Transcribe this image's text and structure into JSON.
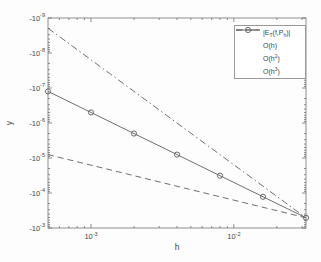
{
  "figure": {
    "title": ""
  },
  "colors": {
    "background": "#fdfdfd",
    "axis": "#8f8f8f",
    "tick": "#6f6f6f",
    "text": "#464646",
    "line": "#6f6f6f",
    "marker": "#5c5c5c"
  },
  "chart_data": {
    "type": "line",
    "title": "",
    "xlabel": "h",
    "ylabel": "y",
    "x_scale": "log",
    "y_scale": "negative-log",
    "grid": false,
    "legend_position": "top-right-inside",
    "xlim": [
      0.0005,
      0.032
    ],
    "ylim_exponents": [
      -9,
      -3
    ],
    "x_tick_base": "10",
    "x_tick_exponents": [
      -3,
      -2
    ],
    "y_tick_base": "-10",
    "y_tick_exponents": [
      -9,
      -8,
      -7,
      -6,
      -5,
      -4,
      -3
    ],
    "minor_x_decades": [
      -4,
      -3,
      -2
    ],
    "minor_y_decades": [
      -9,
      -8,
      -7,
      -6,
      -5,
      -4
    ],
    "data_series": {
      "name": "quadrature-error",
      "marker": "circle",
      "h_values": [
        0.0005,
        0.001,
        0.002,
        0.004,
        0.008,
        0.016,
        0.032
      ],
      "error_values": [
        -1.25e-07,
        -5e-07,
        -2e-06,
        -8e-06,
        -3.2e-05,
        -0.000128,
        -0.000512
      ]
    },
    "reference_lines": [
      {
        "name": "O(h)",
        "style": "dashed",
        "coeff": 0.016,
        "power": 1
      },
      {
        "name": "O(h2)",
        "style": "solid",
        "coeff": 0.5,
        "power": 2
      },
      {
        "name": "O(h3)",
        "style": "dashdot",
        "coeff": 15.625,
        "power": 3
      }
    ],
    "legend": {
      "entries": [
        {
          "sample": "circle",
          "parts": [
            [
              "t",
              "|E"
            ],
            [
              "sub",
              "T"
            ],
            [
              "t",
              "(f,P"
            ],
            [
              "sub",
              "h"
            ],
            [
              "t",
              ")|"
            ]
          ]
        },
        {
          "sample": "dashed",
          "parts": [
            [
              "t",
              "O(h)"
            ]
          ]
        },
        {
          "sample": "solid",
          "parts": [
            [
              "t",
              "O(h"
            ],
            [
              "sup",
              "2"
            ],
            [
              "t",
              ")"
            ]
          ]
        },
        {
          "sample": "dashdot",
          "parts": [
            [
              "t",
              "O(h"
            ],
            [
              "sup",
              "3"
            ],
            [
              "t",
              ")"
            ]
          ]
        }
      ]
    }
  }
}
